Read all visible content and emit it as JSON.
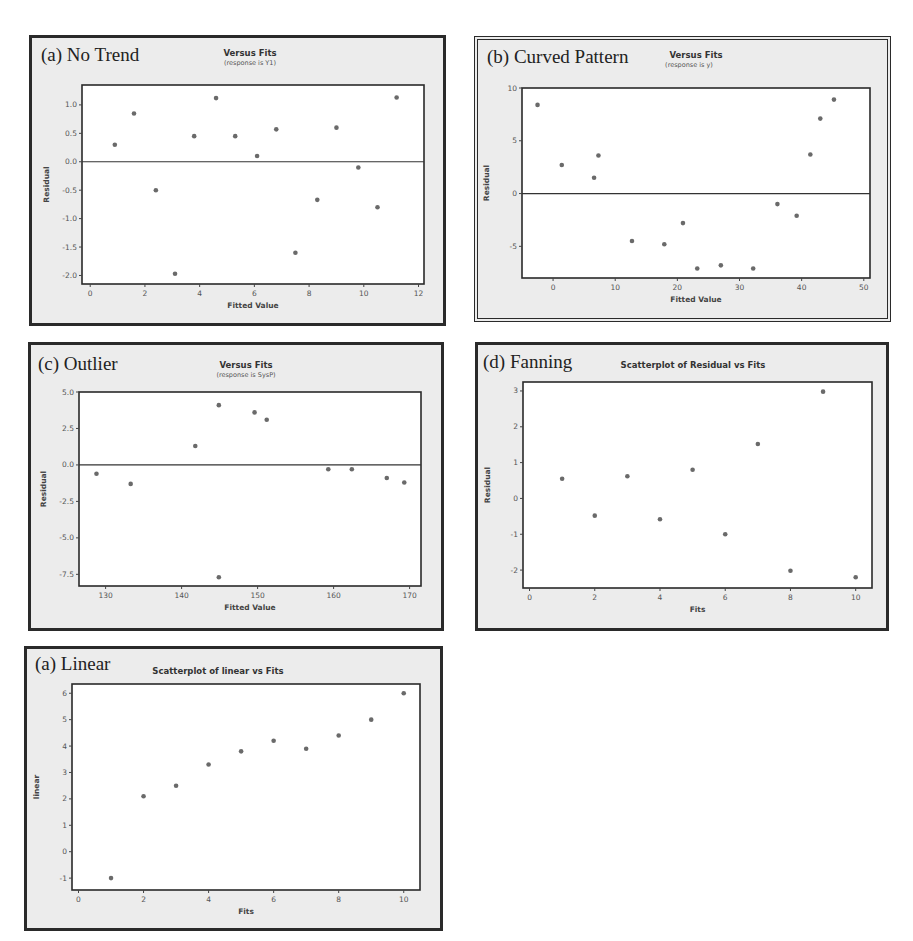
{
  "chart_data": [
    {
      "id": "no-trend",
      "type": "scatter",
      "panel_label": "(a) No Trend",
      "title": "Versus Fits",
      "subtitle": "(response is Y1)",
      "xlabel": "Fitted Value",
      "ylabel": "Residual",
      "xlim": [
        -0.3,
        12.2
      ],
      "ylim": [
        -2.15,
        1.35
      ],
      "xticks": [
        0,
        2,
        4,
        6,
        8,
        10,
        12
      ],
      "xtick_labels": [
        "0",
        "2",
        "4",
        "6",
        "8",
        "10",
        "12"
      ],
      "yticks": [
        1.0,
        0.5,
        0.0,
        -0.5,
        -1.0,
        -1.5,
        -2.0
      ],
      "ytick_labels": [
        "1.0",
        "0.5",
        "0.0",
        "-0.5",
        "-1.0",
        "-1.5",
        "-2.0"
      ],
      "reference_line_y": 0,
      "points": [
        [
          0.9,
          0.3
        ],
        [
          1.6,
          0.85
        ],
        [
          2.4,
          -0.5
        ],
        [
          3.1,
          -1.97
        ],
        [
          3.8,
          0.45
        ],
        [
          4.6,
          1.12
        ],
        [
          5.3,
          0.45
        ],
        [
          6.1,
          0.1
        ],
        [
          6.8,
          0.57
        ],
        [
          7.5,
          -1.6
        ],
        [
          8.3,
          -0.67
        ],
        [
          9.0,
          0.6
        ],
        [
          9.8,
          -0.1
        ],
        [
          10.5,
          -0.8
        ],
        [
          11.2,
          1.13
        ]
      ]
    },
    {
      "id": "curved-pattern",
      "type": "scatter",
      "panel_label": "(b) Curved Pattern",
      "title": "Versus Fits",
      "subtitle": "(response is y)",
      "xlabel": "Fitted Value",
      "ylabel": "Residual",
      "xlim": [
        -5,
        51
      ],
      "ylim": [
        -8,
        10
      ],
      "xticks": [
        0,
        10,
        20,
        30,
        40,
        50
      ],
      "xtick_labels": [
        "0",
        "10",
        "20",
        "30",
        "40",
        "50"
      ],
      "yticks": [
        10,
        5,
        0,
        -5
      ],
      "ytick_labels": [
        "10",
        "5",
        "0",
        "-5"
      ],
      "reference_line_y": 0,
      "points": [
        [
          -2.5,
          8.4
        ],
        [
          1.4,
          2.7
        ],
        [
          6.6,
          1.5
        ],
        [
          7.3,
          3.6
        ],
        [
          12.7,
          -4.5
        ],
        [
          17.9,
          -4.8
        ],
        [
          20.9,
          -2.8
        ],
        [
          23.2,
          -7.1
        ],
        [
          27.0,
          -6.8
        ],
        [
          32.2,
          -7.1
        ],
        [
          36.1,
          -1.0
        ],
        [
          39.2,
          -2.1
        ],
        [
          41.4,
          3.7
        ],
        [
          43.0,
          7.1
        ],
        [
          45.2,
          8.9
        ]
      ]
    },
    {
      "id": "outlier",
      "type": "scatter",
      "panel_label": "(c) Outlier",
      "title": "Versus Fits",
      "subtitle": "(response is SysP)",
      "xlabel": "Fitted Value",
      "ylabel": "Residual",
      "xlim": [
        126.5,
        171.5
      ],
      "ylim": [
        -8.3,
        5.0
      ],
      "xticks": [
        130,
        140,
        150,
        160,
        170
      ],
      "xtick_labels": [
        "130",
        "140",
        "150",
        "160",
        "170"
      ],
      "yticks": [
        5.0,
        2.5,
        0.0,
        -2.5,
        -5.0,
        -7.5
      ],
      "ytick_labels": [
        "5.0",
        "2.5",
        "0.0",
        "-2.5",
        "-5.0",
        "-7.5"
      ],
      "reference_line_y": 0,
      "points": [
        [
          128.8,
          -0.6
        ],
        [
          133.3,
          -1.3
        ],
        [
          141.8,
          1.3
        ],
        [
          144.9,
          4.1
        ],
        [
          144.9,
          -7.7
        ],
        [
          149.6,
          3.6
        ],
        [
          151.2,
          3.1
        ],
        [
          159.3,
          -0.3
        ],
        [
          162.4,
          -0.3
        ],
        [
          167.0,
          -0.9
        ],
        [
          169.3,
          -1.2
        ]
      ]
    },
    {
      "id": "fanning",
      "type": "scatter",
      "panel_label": "(d) Fanning",
      "title": "Scatterplot of Residual vs Fits",
      "subtitle": "",
      "xlabel": "Fits",
      "ylabel": "Residual",
      "xlim": [
        -0.2,
        10.5
      ],
      "ylim": [
        -2.5,
        3.25
      ],
      "xticks": [
        0,
        2,
        4,
        6,
        8,
        10
      ],
      "xtick_labels": [
        "0",
        "2",
        "4",
        "6",
        "8",
        "10"
      ],
      "yticks": [
        3,
        2,
        1,
        0,
        -1,
        -2
      ],
      "ytick_labels": [
        "3",
        "2",
        "1",
        "0",
        "-1",
        "-2"
      ],
      "reference_line_y": null,
      "points": [
        [
          1,
          0.55
        ],
        [
          2,
          -0.48
        ],
        [
          3,
          0.62
        ],
        [
          4,
          -0.58
        ],
        [
          5,
          0.8
        ],
        [
          6,
          -1.0
        ],
        [
          7,
          1.52
        ],
        [
          8,
          -2.02
        ],
        [
          9,
          2.98
        ],
        [
          10,
          -2.2
        ]
      ]
    },
    {
      "id": "linear",
      "type": "scatter",
      "panel_label": "(a) Linear",
      "title": "Scatterplot of linear vs Fits",
      "subtitle": "",
      "xlabel": "Fits",
      "ylabel": "linear",
      "xlim": [
        -0.2,
        10.5
      ],
      "ylim": [
        -1.45,
        6.35
      ],
      "xticks": [
        0,
        2,
        4,
        6,
        8,
        10
      ],
      "xtick_labels": [
        "0",
        "2",
        "4",
        "6",
        "8",
        "10"
      ],
      "yticks": [
        6,
        5,
        4,
        3,
        2,
        1,
        0,
        -1
      ],
      "ytick_labels": [
        "6",
        "5",
        "4",
        "3",
        "2",
        "1",
        "0",
        "-1"
      ],
      "reference_line_y": null,
      "points": [
        [
          1,
          -1.0
        ],
        [
          2,
          2.1
        ],
        [
          3,
          2.5
        ],
        [
          4,
          3.3
        ],
        [
          5,
          3.8
        ],
        [
          6,
          4.2
        ],
        [
          7,
          3.9
        ],
        [
          8,
          4.4
        ],
        [
          9,
          5.0
        ],
        [
          10,
          6.0
        ]
      ]
    }
  ],
  "colors": {
    "panel_bg": "#ececec",
    "plot_bg": "#ffffff",
    "frame": "#2a2a2a",
    "marker": "#6a6a6a",
    "text": "#333333"
  }
}
